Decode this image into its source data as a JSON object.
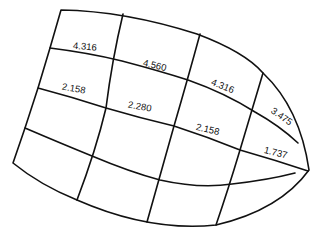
{
  "diagram": {
    "type": "curved-grid",
    "stroke_color": "#111111",
    "background_color": "#ffffff",
    "labels": [
      {
        "id": "r1c1",
        "text": "4.316"
      },
      {
        "id": "r1c2",
        "text": "4.560"
      },
      {
        "id": "r1c3",
        "text": "4.316"
      },
      {
        "id": "r1c4",
        "text": "3.475"
      },
      {
        "id": "r2c1",
        "text": "2.158"
      },
      {
        "id": "r2c2",
        "text": "2.280"
      },
      {
        "id": "r2c3",
        "text": "2.158"
      },
      {
        "id": "r2c4",
        "text": "1.737"
      }
    ]
  }
}
